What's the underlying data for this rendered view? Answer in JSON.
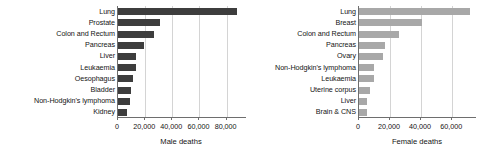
{
  "figure": {
    "width": 480,
    "height": 157,
    "background": "#ffffff"
  },
  "chart_data": [
    {
      "type": "bar",
      "orientation": "horizontal",
      "panel": "left",
      "title": "",
      "xlabel": "Male deaths",
      "ylabel": "",
      "categories": [
        "Lung",
        "Prostate",
        "Colon and Rectum",
        "Pancreas",
        "Liver",
        "Leukaemia",
        "Oesophagus",
        "Bladder",
        "Non-Hodgkin's lymphoma",
        "Kidney"
      ],
      "values": [
        88000,
        30800,
        26400,
        19000,
        13400,
        13200,
        11000,
        9300,
        8900,
        6800
      ],
      "xlim": [
        0,
        95000
      ],
      "xticks": [
        0,
        20000,
        40000,
        60000,
        80000
      ],
      "xticklabels": [
        "0",
        "20,000",
        "40,000",
        "60,000",
        "80,000"
      ],
      "bar_color": "#3d3d3d",
      "grid": "vertical",
      "legend": "none"
    },
    {
      "type": "bar",
      "orientation": "horizontal",
      "panel": "right",
      "title": "",
      "xlabel": "Female deaths",
      "ylabel": "",
      "categories": [
        "Lung",
        "Breast",
        "Colon and Rectum",
        "Pancreas",
        "Ovary",
        "Non-Hodgkin's lymphoma",
        "Leukaemia",
        "Uterine corpus",
        "Liver",
        "Brain & CNS"
      ],
      "values": [
        71300,
        40800,
        25500,
        16700,
        15200,
        9900,
        9400,
        6800,
        5300,
        5300
      ],
      "xlim": [
        0,
        76000
      ],
      "xticks": [
        0,
        20000,
        40000,
        60000
      ],
      "xticklabels": [
        "0",
        "20,000",
        "40,000",
        "60,000"
      ],
      "bar_color": "#a8a8a8",
      "grid": "vertical",
      "legend": "none"
    }
  ],
  "left_panel": {
    "axis_title": "Male deaths",
    "categories": [
      {
        "label": "Lung"
      },
      {
        "label": "Prostate"
      },
      {
        "label": "Colon and Rectum"
      },
      {
        "label": "Pancreas"
      },
      {
        "label": "Liver"
      },
      {
        "label": "Leukaemia"
      },
      {
        "label": "Oesophagus"
      },
      {
        "label": "Bladder"
      },
      {
        "label": "Non-Hodgkin's lymphoma"
      },
      {
        "label": "Kidney"
      }
    ],
    "ticks": [
      {
        "label": "0"
      },
      {
        "label": "20,000"
      },
      {
        "label": "40,000"
      },
      {
        "label": "60,000"
      },
      {
        "label": "80,000"
      }
    ]
  },
  "right_panel": {
    "axis_title": "Female deaths",
    "categories": [
      {
        "label": "Lung"
      },
      {
        "label": "Breast"
      },
      {
        "label": "Colon and Rectum"
      },
      {
        "label": "Pancreas"
      },
      {
        "label": "Ovary"
      },
      {
        "label": "Non-Hodgkin's lymphoma"
      },
      {
        "label": "Leukaemia"
      },
      {
        "label": "Uterine corpus"
      },
      {
        "label": "Liver"
      },
      {
        "label": "Brain & CNS"
      }
    ],
    "ticks": [
      {
        "label": "0"
      },
      {
        "label": "20,000"
      },
      {
        "label": "40,000"
      },
      {
        "label": "60,000"
      }
    ]
  }
}
